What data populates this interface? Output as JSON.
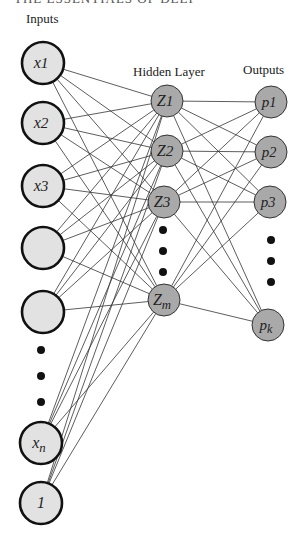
{
  "header": {
    "clipped_title": "THE ESSENTIALS OF DEEP LEARNING"
  },
  "labels": {
    "inputs": "Inputs",
    "hidden": "Hidden Layer",
    "outputs": "Outputs"
  },
  "colors": {
    "input_fill": "#e2e2e2",
    "input_stroke": "#111111",
    "hidden_fill": "#a9a9a9",
    "output_fill": "#a9a9a9",
    "node_stroke": "#333333",
    "edge": "#333333"
  },
  "diagram": {
    "input_nodes": [
      {
        "label": "x1",
        "main": "x",
        "sub": "1",
        "cx": 43,
        "cy": 63
      },
      {
        "label": "x2",
        "main": "x",
        "sub": "2",
        "cx": 43,
        "cy": 123
      },
      {
        "label": "x3",
        "main": "x",
        "sub": "3",
        "cx": 43,
        "cy": 186
      },
      {
        "label": "",
        "main": "",
        "sub": "",
        "cx": 43,
        "cy": 248
      },
      {
        "label": "",
        "main": "",
        "sub": "",
        "cx": 43,
        "cy": 312
      },
      {
        "label": "xn",
        "main": "x",
        "sub": "n",
        "cx": 41,
        "cy": 443
      },
      {
        "label": "1",
        "main": "1",
        "sub": "",
        "cx": 41,
        "cy": 503
      }
    ],
    "input_ellipsis": [
      {
        "cx": 41,
        "cy": 350
      },
      {
        "cx": 41,
        "cy": 376
      },
      {
        "cx": 41,
        "cy": 402
      }
    ],
    "hidden_nodes": [
      {
        "label": "Z1",
        "main": "Z",
        "sub": "1",
        "cx": 167,
        "cy": 101
      },
      {
        "label": "Z2",
        "main": "Z",
        "sub": "2",
        "cx": 167,
        "cy": 151
      },
      {
        "label": "Z3",
        "main": "Z",
        "sub": "3",
        "cx": 164,
        "cy": 202
      },
      {
        "label": "Zm",
        "main": "Z",
        "sub": "m",
        "cx": 164,
        "cy": 300
      }
    ],
    "hidden_ellipsis": [
      {
        "cx": 163,
        "cy": 230
      },
      {
        "cx": 163,
        "cy": 251
      },
      {
        "cx": 163,
        "cy": 272
      }
    ],
    "output_nodes": [
      {
        "label": "p1",
        "main": "p",
        "sub": "1",
        "cx": 271,
        "cy": 102
      },
      {
        "label": "p2",
        "main": "p",
        "sub": "2",
        "cx": 271,
        "cy": 152
      },
      {
        "label": "p3",
        "main": "p",
        "sub": "3",
        "cx": 270,
        "cy": 202
      },
      {
        "label": "pk",
        "main": "p",
        "sub": "k",
        "cx": 268,
        "cy": 325
      }
    ],
    "output_ellipsis": [
      {
        "cx": 271,
        "cy": 240
      },
      {
        "cx": 271,
        "cy": 261
      },
      {
        "cx": 271,
        "cy": 282
      }
    ],
    "radii": {
      "input": 21,
      "hidden": 16,
      "output": 16
    }
  }
}
